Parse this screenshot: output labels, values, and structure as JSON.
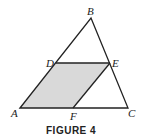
{
  "figure": {
    "caption": "FIGURE 4",
    "fill_color": "#d9d9d9",
    "stroke_color": "#222222",
    "points": {
      "A": {
        "label": "A",
        "x": 20,
        "y": 108
      },
      "B": {
        "label": "B",
        "x": 91,
        "y": 18
      },
      "C": {
        "label": "C",
        "x": 128,
        "y": 108
      },
      "D": {
        "label": "D",
        "x": 56,
        "y": 63
      },
      "E": {
        "label": "E",
        "x": 110,
        "y": 63
      },
      "F": {
        "label": "F",
        "x": 73,
        "y": 108
      }
    },
    "shaded_region": [
      "A",
      "D",
      "E",
      "F"
    ],
    "triangle": [
      "A",
      "B",
      "C"
    ]
  }
}
